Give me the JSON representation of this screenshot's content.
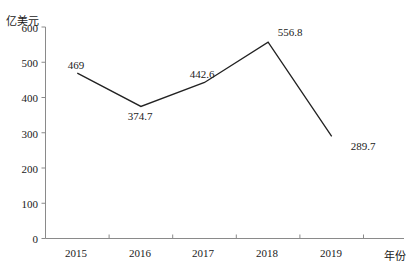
{
  "chart_data": {
    "type": "line",
    "title": "",
    "xlabel": "年份",
    "ylabel": "亿美元",
    "categories": [
      "2015",
      "2016",
      "2017",
      "2018",
      "2019"
    ],
    "values": [
      469,
      374.7,
      442.6,
      556.8,
      289.7
    ],
    "point_labels": [
      "469",
      "374.7",
      "442.6",
      "556.8",
      "289.7"
    ],
    "series": [
      {
        "name": "",
        "values": [
          469,
          374.7,
          442.6,
          556.8,
          289.7
        ]
      }
    ],
    "ylim": [
      0,
      600
    ],
    "ytick_values": [
      600,
      500,
      400,
      300,
      200,
      100,
      0
    ],
    "ytick_labels": [
      "600",
      "500",
      "400",
      "300",
      "200",
      "100",
      "0"
    ],
    "grid": false,
    "legend": null,
    "legend_position": "none",
    "line_color": "#222222",
    "axis_color": "#888888",
    "background_color": "#ffffff",
    "annotations": []
  },
  "axes": {
    "y_unit_label": "亿美元",
    "x_title": "年份"
  }
}
